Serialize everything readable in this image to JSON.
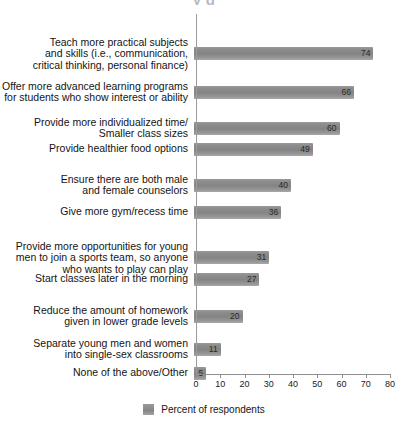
{
  "title_fragment": "y g",
  "legend": {
    "label": "Percent of respondents",
    "swatch_color": "#8a8a8a"
  },
  "axis": {
    "tick_labels": [
      "0",
      "10",
      "20",
      "30",
      "40",
      "50",
      "60",
      "70",
      "80"
    ]
  },
  "chart_data": {
    "type": "bar",
    "orientation": "horizontal",
    "title": "",
    "xlabel": "Percent of respondents",
    "ylabel": "",
    "xlim": [
      0,
      80
    ],
    "xticks": [
      0,
      10,
      20,
      30,
      40,
      50,
      60,
      70,
      80
    ],
    "grid": false,
    "legend_position": "bottom-center",
    "legend_entries": [
      "Percent of respondents"
    ],
    "bar_color": "#8a8a8a",
    "categories": [
      "Teach more practical subjects and skills (i.e., communication, critical thinking, personal finance)",
      "Offer more advanced learning programs for students who show interest or ability",
      "Provide more individualized time/ Smaller class sizes",
      "Provide healthier food options",
      "Ensure there are both male and female counselors",
      "Give more gym/recess time",
      "Provide more opportunities for young men to join a sports team, so anyone who wants to play can play",
      "Start classes later in the morning",
      "Reduce the amount of homework given in lower grade levels",
      "Separate young men and women into single-sex classrooms",
      "None of the above/Other"
    ],
    "values": [
      74,
      66,
      60,
      49,
      40,
      36,
      31,
      27,
      20,
      11,
      5
    ],
    "rows": [
      {
        "label": "Teach more practical subjects\nand skills (i.e., communication,\ncritical thinking, personal finance)",
        "value": 74,
        "value_text": "74"
      },
      {
        "label": "Offer more advanced learning programs\nfor students who show interest or ability",
        "value": 66,
        "value_text": "66"
      },
      {
        "label": "Provide more individualized time/\nSmaller class sizes",
        "value": 60,
        "value_text": "60"
      },
      {
        "label": "Provide healthier food options",
        "value": 49,
        "value_text": "49"
      },
      {
        "label": "Ensure there are both male\nand female counselors",
        "value": 40,
        "value_text": "40"
      },
      {
        "label": "Give more gym/recess time",
        "value": 36,
        "value_text": "36"
      },
      {
        "label": "Provide more opportunities for young\nmen to join a sports team, so anyone\nwho wants to play can play",
        "value": 31,
        "value_text": "31"
      },
      {
        "label": "Start classes later in the morning",
        "value": 27,
        "value_text": "27"
      },
      {
        "label": "Reduce the amount of homework\ngiven in lower grade levels",
        "value": 20,
        "value_text": "20"
      },
      {
        "label": "Separate young men and women\ninto single-sex classrooms",
        "value": 11,
        "value_text": "11"
      },
      {
        "label": "None of the above/Other",
        "value": 5,
        "value_text": "5"
      }
    ]
  }
}
